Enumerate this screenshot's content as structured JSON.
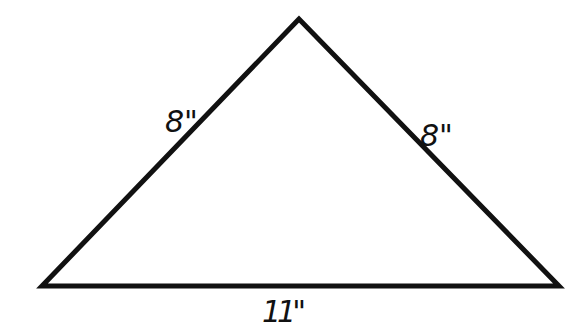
{
  "diagram": {
    "shape": "isosceles triangle",
    "stroke_color": "#111111",
    "background": "#ffffff",
    "vertices": {
      "apex": [
        299,
        19
      ],
      "bottom_left": [
        42,
        286
      ],
      "bottom_right": [
        559,
        286
      ]
    },
    "labels": {
      "left_side": "8\"",
      "right_side": "8\"",
      "base": "11\""
    }
  }
}
